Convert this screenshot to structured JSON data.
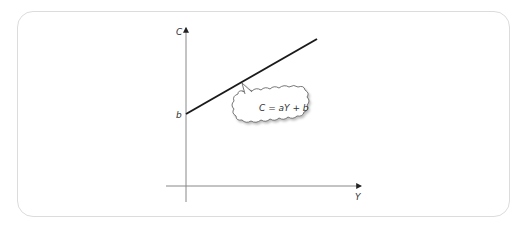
{
  "diagram": {
    "type": "linear-function-graph",
    "axes": {
      "y_axis_label": "C",
      "x_axis_label": "Y"
    },
    "intercept_label": "b",
    "callout": {
      "text": "C = aY + b",
      "shape": "cloud"
    },
    "colors": {
      "frame_border": "#dcdcdc",
      "axis": "#888888",
      "line": "#1a1a1a",
      "text": "#333333"
    }
  }
}
